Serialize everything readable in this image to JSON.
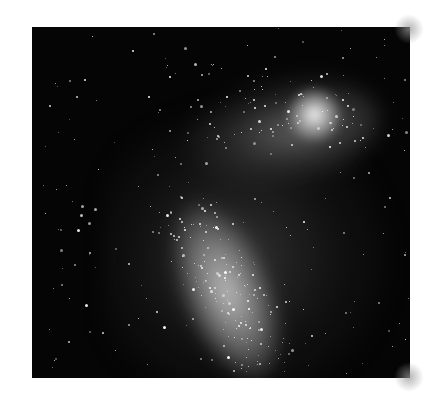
{
  "image": {
    "subject": "galaxy-photograph",
    "description": "Black and white astronomical photograph of an irregular galaxy with a bright diagonal bar and a bright nebula near the top right",
    "background_color": "#ffffff",
    "photo_background": "#050505",
    "star_count": 420
  }
}
